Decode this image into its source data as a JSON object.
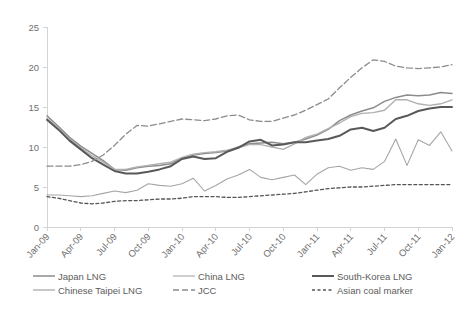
{
  "chart_data": {
    "type": "line",
    "title": "",
    "xlabel": "",
    "ylabel": "",
    "ylim": [
      0,
      25
    ],
    "yticks": [
      0,
      5,
      10,
      15,
      20,
      25
    ],
    "grid": false,
    "legend_position": "bottom",
    "x": [
      "Jan-09",
      "Feb-09",
      "Mar-09",
      "Apr-09",
      "May-09",
      "Jun-09",
      "Jul-09",
      "Aug-09",
      "Sep-09",
      "Oct-09",
      "Nov-09",
      "Dec-09",
      "Jan-10",
      "Feb-10",
      "Mar-10",
      "Apr-10",
      "May-10",
      "Jun-10",
      "Jul-10",
      "Aug-10",
      "Sep-10",
      "Oct-10",
      "Nov-10",
      "Dec-10",
      "Jan-11",
      "Feb-11",
      "Mar-11",
      "Apr-11",
      "May-11",
      "Jun-11",
      "Jul-11",
      "Aug-11",
      "Sep-11",
      "Oct-11",
      "Nov-11",
      "Dec-11",
      "Jan-12"
    ],
    "xtick_labels": [
      "Jan-09",
      "Apr-09",
      "Jul-09",
      "Oct-09",
      "Jan-10",
      "Apr-10",
      "Jul-10",
      "Oct-10",
      "Jan-11",
      "Apr-11",
      "Jul-11",
      "Oct-11",
      "Jan-12"
    ],
    "series": [
      {
        "name": "Japan LNG",
        "color": "#8c8c8c",
        "width": 1.5,
        "dash": "none",
        "values": [
          13.9,
          12.6,
          11.2,
          10.1,
          9.2,
          8.3,
          7.2,
          7.1,
          7.4,
          7.6,
          7.7,
          7.9,
          8.6,
          9.0,
          9.2,
          9.3,
          9.5,
          10.0,
          10.4,
          10.5,
          10.6,
          10.4,
          10.6,
          11.0,
          11.5,
          12.2,
          13.3,
          14.0,
          14.5,
          14.9,
          15.7,
          16.2,
          16.5,
          16.4,
          16.5,
          16.8,
          16.7
        ]
      },
      {
        "name": "Chinese Taipei LNG",
        "color": "#b0b0b0",
        "width": 1.4,
        "dash": "none",
        "values": [
          13.6,
          12.4,
          11.0,
          9.9,
          8.9,
          8.1,
          7.2,
          7.2,
          7.5,
          7.7,
          7.9,
          8.1,
          8.7,
          9.1,
          9.3,
          9.4,
          9.6,
          9.9,
          10.3,
          10.3,
          10.0,
          9.7,
          10.4,
          11.2,
          11.6,
          12.3,
          13.0,
          13.8,
          14.2,
          14.3,
          14.6,
          15.9,
          15.9,
          15.4,
          15.2,
          15.4,
          15.9
        ]
      },
      {
        "name": "South-Korea LNG",
        "color": "#595959",
        "width": 2.0,
        "dash": "none",
        "values": [
          13.4,
          12.2,
          10.8,
          9.7,
          8.6,
          7.8,
          7.0,
          6.7,
          6.7,
          6.9,
          7.2,
          7.6,
          8.5,
          8.8,
          8.5,
          8.6,
          9.4,
          9.9,
          10.7,
          10.9,
          10.2,
          10.3,
          10.6,
          10.6,
          10.8,
          11.0,
          11.4,
          12.2,
          12.4,
          12.0,
          12.4,
          13.5,
          13.9,
          14.5,
          14.8,
          15.0,
          15.0
        ]
      },
      {
        "name": "China LNG",
        "color": "#a6a6a6",
        "width": 1.1,
        "dash": "none",
        "values": [
          4.0,
          4.0,
          3.9,
          3.8,
          3.9,
          4.2,
          4.5,
          4.3,
          4.6,
          5.4,
          5.2,
          5.1,
          5.4,
          6.1,
          4.5,
          5.2,
          6.0,
          6.5,
          7.2,
          6.2,
          5.9,
          6.2,
          6.5,
          5.3,
          6.6,
          7.4,
          7.6,
          7.1,
          7.4,
          7.2,
          8.2,
          11.0,
          7.7,
          10.9,
          10.2,
          11.9,
          9.5
        ]
      },
      {
        "name": "JCC",
        "color": "#8c8c8c",
        "width": 1.3,
        "dash": "6,3",
        "values": [
          7.6,
          7.6,
          7.6,
          7.8,
          8.2,
          9.0,
          10.2,
          11.6,
          12.7,
          12.6,
          12.9,
          13.2,
          13.5,
          13.4,
          13.3,
          13.5,
          13.9,
          14.0,
          13.4,
          13.2,
          13.2,
          13.6,
          14.0,
          14.6,
          15.3,
          16.0,
          17.4,
          18.7,
          19.9,
          20.9,
          20.7,
          20.1,
          19.9,
          19.8,
          19.9,
          20.0,
          20.3
        ]
      },
      {
        "name": "Asian coal marker",
        "color": "#555555",
        "width": 1.3,
        "dash": "3,2.5",
        "values": [
          3.8,
          3.6,
          3.3,
          3.0,
          2.9,
          3.0,
          3.2,
          3.3,
          3.3,
          3.4,
          3.5,
          3.5,
          3.6,
          3.8,
          3.8,
          3.8,
          3.7,
          3.7,
          3.8,
          3.9,
          4.0,
          4.1,
          4.2,
          4.4,
          4.6,
          4.8,
          4.9,
          5.0,
          5.0,
          5.1,
          5.2,
          5.3,
          5.3,
          5.3,
          5.3,
          5.3,
          5.3
        ]
      }
    ]
  },
  "legend": [
    {
      "label": "Japan LNG"
    },
    {
      "label": "China LNG"
    },
    {
      "label": "South-Korea LNG"
    },
    {
      "label": "Chinese Taipei LNG"
    },
    {
      "label": "JCC"
    },
    {
      "label": "Asian coal marker"
    }
  ]
}
